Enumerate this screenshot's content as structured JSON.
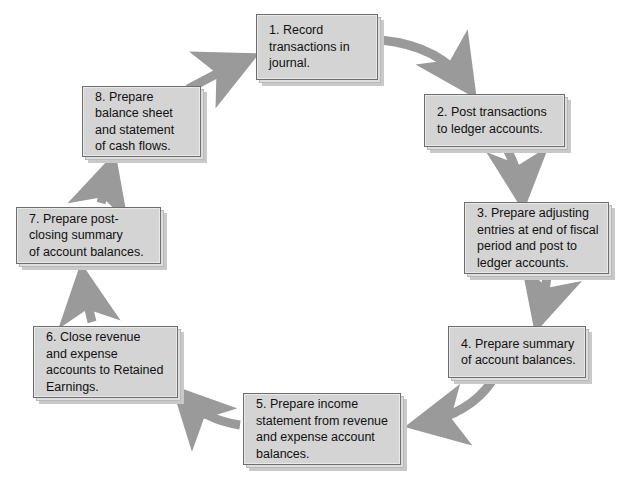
{
  "diagram": {
    "caption_partial": "",
    "type": "cycle-flowchart",
    "background_color": "#ffffff",
    "box_fill_color": "#d4d4d4",
    "box_border_color": "#6e6e6e",
    "box_shadow_color": "#c9c9c9",
    "arrow_color": "#9a9a9a",
    "text_color": "#111111",
    "direction": "clockwise",
    "steps": [
      {
        "number": "1",
        "text": "1. Record\ntransactions in\njournal.",
        "name": "record-transactions-in-journal"
      },
      {
        "number": "2",
        "text": "2. Post transactions\nto ledger accounts.",
        "name": "post-transactions-to-ledger"
      },
      {
        "number": "3",
        "text": "3. Prepare adjusting\nentries at end of fiscal\nperiod and post to\nledger accounts.",
        "name": "prepare-adjusting-entries"
      },
      {
        "number": "4",
        "text": "4. Prepare summary\nof account balances.",
        "name": "prepare-summary-of-balances"
      },
      {
        "number": "5",
        "text": "5. Prepare income\nstatement from revenue\nand expense account\nbalances.",
        "name": "prepare-income-statement"
      },
      {
        "number": "6",
        "text": "6. Close revenue\nand expense\naccounts to Retained\nEarnings.",
        "name": "close-revenue-expense-accounts"
      },
      {
        "number": "7",
        "text": "7. Prepare post-\nclosing summary\nof account balances.",
        "name": "prepare-post-closing-summary"
      },
      {
        "number": "8",
        "text": "8. Prepare\nbalance sheet\nand statement\nof cash flows.",
        "name": "prepare-balance-sheet"
      }
    ],
    "connections": [
      {
        "from": "1",
        "to": "2",
        "name": "arrow-1-to-2"
      },
      {
        "from": "2",
        "to": "3",
        "name": "arrow-2-to-3"
      },
      {
        "from": "3",
        "to": "4",
        "name": "arrow-3-to-4"
      },
      {
        "from": "4",
        "to": "5",
        "name": "arrow-4-to-5"
      },
      {
        "from": "5",
        "to": "6",
        "name": "arrow-5-to-6"
      },
      {
        "from": "6",
        "to": "7",
        "name": "arrow-6-to-7"
      },
      {
        "from": "7",
        "to": "8",
        "name": "arrow-7-to-8"
      },
      {
        "from": "8",
        "to": "1",
        "name": "arrow-8-to-1"
      }
    ]
  }
}
